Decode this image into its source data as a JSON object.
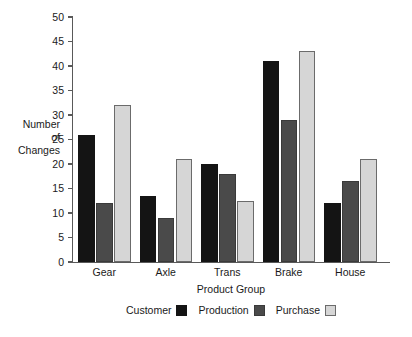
{
  "chart_data": {
    "type": "bar",
    "title": "",
    "xlabel": "Product Group",
    "ylabel": "Number of Changes",
    "ylabel_lines": [
      "Number",
      "of",
      "Changes"
    ],
    "categories": [
      "Gear",
      "Axle",
      "Trans",
      "Brake",
      "House"
    ],
    "series": [
      {
        "name": "Customer",
        "color": "#141414",
        "values": [
          26,
          13.5,
          20,
          41,
          12
        ]
      },
      {
        "name": "Production",
        "color": "#4a4a4a",
        "values": [
          12,
          9,
          18,
          29,
          16.5
        ]
      },
      {
        "name": "Purchase",
        "color": "#d6d6d6",
        "values": [
          32,
          21,
          12.5,
          43,
          21
        ]
      }
    ],
    "ylim": [
      0,
      50
    ],
    "ytick_step": 5,
    "yticks": [
      0,
      5,
      10,
      15,
      20,
      25,
      30,
      35,
      40,
      45,
      50
    ],
    "ytick_labels": [
      "0",
      "5",
      "10",
      "15",
      "20",
      "25",
      "30",
      "35",
      "40",
      "45",
      "50"
    ],
    "grid": false,
    "legend_position": "bottom",
    "legend_label_before_swatch": true,
    "background": "#ffffff",
    "axis_color": "#595959"
  }
}
